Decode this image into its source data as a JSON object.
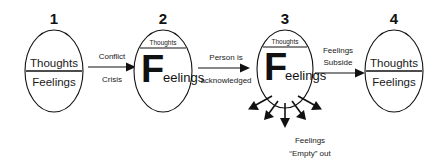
{
  "diagram": {
    "background_color": "#ffffff",
    "stroke_color": "#111111",
    "stages": [
      {
        "number": "1",
        "top_label": "Thoughts",
        "bottom_label": "Feelings",
        "style": "balanced"
      },
      {
        "number": "2",
        "top_label": "Thoughts",
        "bottom_label_cap": "F",
        "bottom_label_rest": "eelings",
        "style": "feelings-dominant"
      },
      {
        "number": "3",
        "top_label": "Thoughts",
        "bottom_label_cap": "F",
        "bottom_label_rest": "eelings",
        "style": "feelings-dominant-venting"
      },
      {
        "number": "4",
        "top_label": "Thoughts",
        "bottom_label": "Feelings",
        "style": "balanced"
      }
    ],
    "connectors": [
      {
        "id": "conflict-crisis",
        "line_1": "Conflict",
        "line_2": "Crisis"
      },
      {
        "id": "person-acknowledged",
        "line_1": "Person is",
        "line_2": "acknowledged"
      },
      {
        "id": "feelings-subside",
        "line_1": "Feelings",
        "line_2": "Subside"
      }
    ],
    "caption": {
      "line_1": "Feelings",
      "line_2": "“Empty” out"
    }
  }
}
